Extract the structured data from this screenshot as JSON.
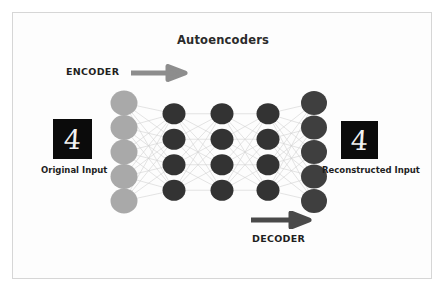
{
  "diagram": {
    "title": "Autoencoders",
    "background_color": "#ffffff",
    "border_color": "#d6d6d6"
  },
  "encoder": {
    "label": "ENCODER",
    "arrow_icon": "arrow-right-icon",
    "arrow_color": "#8d8d8d",
    "arrow_direction": "right"
  },
  "decoder": {
    "label": "DECODER",
    "arrow_icon": "arrow-right-icon",
    "arrow_color": "#4a4a4a",
    "arrow_direction": "right"
  },
  "input_sample": {
    "caption": "Original Input",
    "digit": "4",
    "tile_background": "#0b0b0b",
    "digit_color": "#f2f2f2"
  },
  "output_sample": {
    "caption": "Reconstructed Input",
    "digit": "4",
    "tile_background": "#0b0b0b",
    "digit_color": "#f2f2f2"
  },
  "network": {
    "edge_color": "#d2d2d2",
    "layers": [
      {
        "name": "input-layer",
        "node_count": 5,
        "color": "#a9a9a9",
        "cx": 124,
        "cy": 152,
        "radius": 13.5,
        "spacing": 24.5
      },
      {
        "name": "encoder-hidden-layer",
        "node_count": 4,
        "color": "#333333",
        "cx": 174,
        "cy": 152,
        "radius": 11.5,
        "spacing": 25.5
      },
      {
        "name": "bottleneck-layer",
        "node_count": 4,
        "color": "#333333",
        "cx": 222,
        "cy": 152,
        "radius": 11.5,
        "spacing": 25.5
      },
      {
        "name": "decoder-hidden-layer",
        "node_count": 4,
        "color": "#333333",
        "cx": 268,
        "cy": 152,
        "radius": 11.5,
        "spacing": 25.5
      },
      {
        "name": "output-layer",
        "node_count": 5,
        "color": "#3f3f3f",
        "cx": 314,
        "cy": 152,
        "radius": 13.0,
        "spacing": 24.5
      }
    ]
  }
}
